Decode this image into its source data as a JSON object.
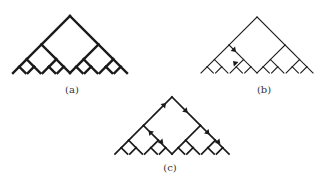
{
  "figure": {
    "stroke_color": "#1a1a1a",
    "panels": [
      {
        "id": "a",
        "label": "(a)",
        "apex": [
          70,
          16
        ],
        "half_width": 57,
        "height": 57,
        "weight": "bold",
        "arrows": []
      },
      {
        "id": "b",
        "label": "(b)",
        "apex": [
          257,
          17
        ],
        "half_width": 57,
        "height": 56,
        "weight": "thin",
        "arrows": [
          "down-right at level 2 left subtree",
          "up-left at level 3"
        ]
      },
      {
        "id": "c",
        "label": "(c)",
        "apex": [
          172,
          97
        ],
        "half_width": 57,
        "height": 57,
        "weight": "medium",
        "arrows": [
          "up-right to root",
          "down-right from root",
          "up-left inner left",
          "down-right inner right"
        ]
      }
    ]
  }
}
